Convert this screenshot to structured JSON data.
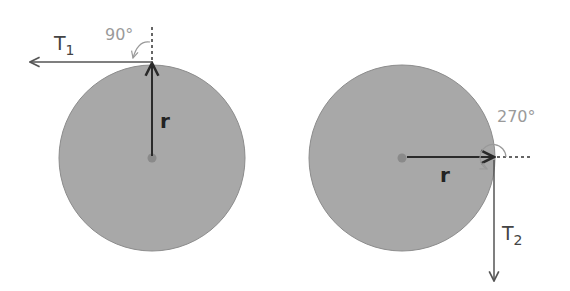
{
  "diagram": {
    "left_disk": {
      "force_label": "T",
      "force_subscript": "1",
      "angle_label": "90°",
      "radius_label": "r",
      "force_direction": "left (tangent at top)",
      "radius_direction": "up from center"
    },
    "right_disk": {
      "force_label": "T",
      "force_subscript": "2",
      "angle_label": "270°",
      "radius_label": "r",
      "force_direction": "down (tangent at right)",
      "radius_direction": "right from center"
    },
    "colors": {
      "disk_fill": "#a8a8a8",
      "disk_stroke": "#8c8c8c",
      "arrow": "#2a2a2a",
      "force_arrow": "#555555",
      "angle_text": "#9a9a9a",
      "center_dot": "#8a8a8a"
    }
  }
}
